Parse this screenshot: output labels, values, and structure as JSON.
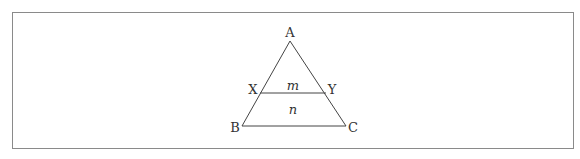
{
  "figure": {
    "frame": {
      "x": 12,
      "y": 12,
      "width": 561,
      "height": 136,
      "stroke": "#8a8a8a"
    },
    "line_color": "#444444",
    "points": {
      "A": {
        "x": 290,
        "y": 41
      },
      "B": {
        "x": 242,
        "y": 126
      },
      "C": {
        "x": 346,
        "y": 126
      },
      "X": {
        "x": 260,
        "y": 93
      },
      "Y": {
        "x": 326,
        "y": 93
      }
    },
    "labels": {
      "A": "A",
      "B": "B",
      "C": "C",
      "X": "X",
      "Y": "Y",
      "region_top": "m",
      "region_bottom": "n"
    }
  }
}
